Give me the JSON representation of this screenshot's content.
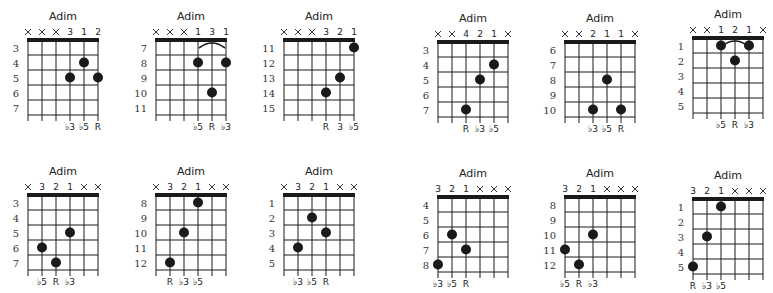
{
  "page": {
    "background": "#ffffff",
    "ink": "#1a1a1a"
  },
  "chords": [
    {
      "id": "c1",
      "name": "Adim",
      "row": 0,
      "x": 6,
      "y": 10,
      "start_fret": 3,
      "fret_labels": [
        "3",
        "4",
        "5",
        "6",
        "7"
      ],
      "top": [
        "x",
        "x",
        "x",
        "3",
        "1",
        "2"
      ],
      "nut": true,
      "dots": [
        {
          "string": 5,
          "fret": 4
        },
        {
          "string": 4,
          "fret": 5
        },
        {
          "string": 6,
          "fret": 5
        }
      ],
      "barre": null,
      "bottom": [
        "",
        "",
        "",
        "♭3",
        "♭5",
        "R"
      ]
    },
    {
      "id": "c2",
      "name": "Adim",
      "row": 0,
      "x": 134,
      "y": 10,
      "start_fret": 7,
      "fret_labels": [
        "7",
        "8",
        "9",
        "10",
        "11"
      ],
      "top": [
        "x",
        "x",
        "x",
        "1",
        "3",
        "1"
      ],
      "nut": true,
      "dots": [
        {
          "string": 4,
          "fret": 8
        },
        {
          "string": 6,
          "fret": 8
        },
        {
          "string": 5,
          "fret": 10
        }
      ],
      "barre": {
        "from": 4,
        "to": 6
      },
      "bottom": [
        "",
        "",
        "",
        "♭5",
        "R",
        "♭3"
      ]
    },
    {
      "id": "c3",
      "name": "Adim",
      "row": 0,
      "x": 262,
      "y": 10,
      "start_fret": 11,
      "fret_labels": [
        "11",
        "12",
        "13",
        "14",
        "15"
      ],
      "top": [
        "x",
        "x",
        "x",
        "3",
        "2",
        "1"
      ],
      "nut": true,
      "dots": [
        {
          "string": 6,
          "fret": 11
        },
        {
          "string": 5,
          "fret": 13
        },
        {
          "string": 4,
          "fret": 14
        }
      ],
      "barre": null,
      "bottom": [
        "",
        "",
        "",
        "R",
        "3",
        "♭5"
      ]
    },
    {
      "id": "c4",
      "name": "Adim",
      "row": 0,
      "x": 416,
      "y": 12,
      "start_fret": 3,
      "fret_labels": [
        "3",
        "4",
        "5",
        "6",
        "7"
      ],
      "top": [
        "x",
        "x",
        "4",
        "2",
        "1",
        "x"
      ],
      "nut": true,
      "dots": [
        {
          "string": 5,
          "fret": 4
        },
        {
          "string": 4,
          "fret": 5
        },
        {
          "string": 3,
          "fret": 7
        }
      ],
      "barre": null,
      "bottom": [
        "",
        "",
        "R",
        "♭3",
        "♭5",
        ""
      ]
    },
    {
      "id": "c5",
      "name": "Adim",
      "row": 0,
      "x": 543,
      "y": 12,
      "start_fret": 6,
      "fret_labels": [
        "6",
        "7",
        "8",
        "9",
        "10"
      ],
      "top": [
        "x",
        "x",
        "2",
        "1",
        "1",
        "x"
      ],
      "nut": true,
      "dots": [
        {
          "string": 4,
          "fret": 8
        },
        {
          "string": 3,
          "fret": 10
        },
        {
          "string": 5,
          "fret": 10
        }
      ],
      "barre": null,
      "bottom": [
        "",
        "",
        "♭3",
        "♭5",
        "R",
        ""
      ]
    },
    {
      "id": "c6",
      "name": "Adim",
      "row": 0,
      "x": 671,
      "y": 8,
      "start_fret": 1,
      "fret_labels": [
        "1",
        "2",
        "3",
        "4",
        "5"
      ],
      "top": [
        "x",
        "x",
        "1",
        "2",
        "1",
        "x"
      ],
      "nut": true,
      "dots": [
        {
          "string": 3,
          "fret": 1
        },
        {
          "string": 5,
          "fret": 1
        },
        {
          "string": 4,
          "fret": 2
        }
      ],
      "barre": {
        "from": 3,
        "to": 5
      },
      "bottom": [
        "",
        "",
        "♭5",
        "R",
        "♭3",
        ""
      ]
    },
    {
      "id": "c7",
      "name": "Adim",
      "row": 1,
      "x": 6,
      "y": 165,
      "start_fret": 3,
      "fret_labels": [
        "3",
        "4",
        "5",
        "6",
        "7"
      ],
      "top": [
        "x",
        "3",
        "2",
        "1",
        "x",
        "x"
      ],
      "nut": true,
      "dots": [
        {
          "string": 4,
          "fret": 5
        },
        {
          "string": 2,
          "fret": 6
        },
        {
          "string": 3,
          "fret": 7
        }
      ],
      "barre": null,
      "bottom": [
        "",
        "♭5",
        "R",
        "♭3",
        "",
        ""
      ]
    },
    {
      "id": "c8",
      "name": "Adim",
      "row": 1,
      "x": 134,
      "y": 165,
      "start_fret": 8,
      "fret_labels": [
        "8",
        "9",
        "10",
        "11",
        "12"
      ],
      "top": [
        "x",
        "3",
        "2",
        "1",
        "x",
        "x"
      ],
      "nut": true,
      "dots": [
        {
          "string": 4,
          "fret": 8
        },
        {
          "string": 3,
          "fret": 10
        },
        {
          "string": 2,
          "fret": 12
        }
      ],
      "barre": null,
      "bottom": [
        "",
        "R",
        "♭3",
        "♭5",
        "",
        ""
      ]
    },
    {
      "id": "c9",
      "name": "Adim",
      "row": 1,
      "x": 262,
      "y": 165,
      "start_fret": 1,
      "fret_labels": [
        "1",
        "2",
        "3",
        "4",
        "5"
      ],
      "top": [
        "x",
        "3",
        "2",
        "1",
        "x",
        "x"
      ],
      "nut": true,
      "dots": [
        {
          "string": 3,
          "fret": 2
        },
        {
          "string": 4,
          "fret": 3
        },
        {
          "string": 2,
          "fret": 4
        }
      ],
      "barre": null,
      "bottom": [
        "",
        "♭3",
        "♭5",
        "R",
        "",
        ""
      ]
    },
    {
      "id": "c10",
      "name": "Adim",
      "row": 1,
      "x": 416,
      "y": 167,
      "start_fret": 4,
      "fret_labels": [
        "4",
        "5",
        "6",
        "7",
        "8"
      ],
      "top": [
        "3",
        "2",
        "1",
        "x",
        "x",
        "x"
      ],
      "nut": true,
      "dots": [
        {
          "string": 2,
          "fret": 6
        },
        {
          "string": 3,
          "fret": 7
        },
        {
          "string": 1,
          "fret": 8
        }
      ],
      "barre": null,
      "bottom": [
        "♭3",
        "♭5",
        "R",
        "",
        "",
        ""
      ]
    },
    {
      "id": "c11",
      "name": "Adim",
      "row": 1,
      "x": 543,
      "y": 167,
      "start_fret": 8,
      "fret_labels": [
        "8",
        "9",
        "10",
        "11",
        "12"
      ],
      "top": [
        "3",
        "2",
        "1",
        "x",
        "x",
        "x"
      ],
      "nut": true,
      "dots": [
        {
          "string": 3,
          "fret": 10
        },
        {
          "string": 1,
          "fret": 11
        },
        {
          "string": 2,
          "fret": 12
        }
      ],
      "barre": null,
      "bottom": [
        "♭5",
        "R",
        "♭3",
        "",
        "",
        ""
      ]
    },
    {
      "id": "c12",
      "name": "Adim",
      "row": 1,
      "x": 671,
      "y": 169,
      "start_fret": 1,
      "fret_labels": [
        "1",
        "2",
        "3",
        "4",
        "5"
      ],
      "top": [
        "3",
        "2",
        "1",
        "x",
        "x",
        "x"
      ],
      "nut": true,
      "dots": [
        {
          "string": 3,
          "fret": 1
        },
        {
          "string": 2,
          "fret": 3
        },
        {
          "string": 1,
          "fret": 5
        }
      ],
      "barre": null,
      "bottom": [
        "R",
        "♭3",
        "♭5",
        "",
        "",
        ""
      ]
    }
  ]
}
